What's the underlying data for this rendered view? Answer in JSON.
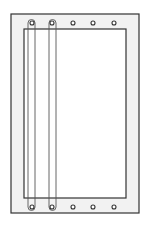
{
  "diagram": {
    "type": "frame-with-grommets",
    "colors": {
      "background": "#ffffff",
      "frame_fill": "#f2f2f2",
      "line": "#333333",
      "strip_line": "#555555"
    },
    "outer_frame": {
      "x": 11,
      "y": 14,
      "w": 128,
      "h": 199
    },
    "inner_panel": {
      "x": 24,
      "y": 29,
      "w": 102,
      "h": 169
    },
    "holes_top_y": 23,
    "holes_bottom_y": 207,
    "holes_x": [
      32,
      52,
      73,
      93,
      114
    ],
    "strips": [
      {
        "x": 28,
        "w": 7
      },
      {
        "x": 49,
        "w": 7
      }
    ]
  }
}
